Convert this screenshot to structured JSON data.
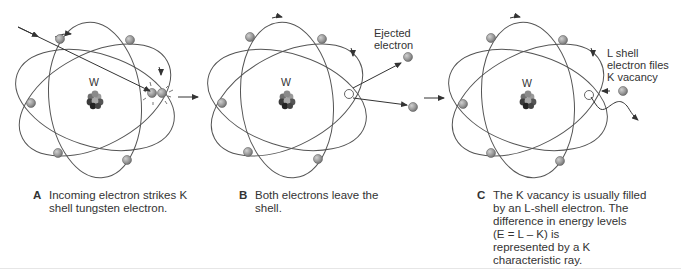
{
  "figure": {
    "panels": [
      {
        "id": "A",
        "letter": "A",
        "caption_lines": [
          "Incoming electron strikes K",
          "shell tungsten electron."
        ],
        "nucleus_label": "W"
      },
      {
        "id": "B",
        "letter": "B",
        "caption_lines": [
          "Both electrons leave the",
          "shell."
        ],
        "nucleus_label": "W",
        "annotation_lines": [
          "Ejected",
          "electron"
        ]
      },
      {
        "id": "C",
        "letter": "C",
        "caption_lines": [
          "The K vacancy is usually filled",
          "by an L-shell electron. The",
          "difference in energy levels",
          "(E = L – K) is",
          "represented by a K",
          "characteristic ray."
        ],
        "nucleus_label": "W",
        "annotation_lines": [
          "L shell",
          "electron files",
          "K vacancy"
        ]
      }
    ],
    "colors": {
      "orbit": "#555555",
      "electron": "#9a9a9a",
      "electron_edge": "#666666",
      "nucleus_dark": "#222222",
      "nucleus_mid": "#777777",
      "vacancy": "#ffffff"
    }
  }
}
